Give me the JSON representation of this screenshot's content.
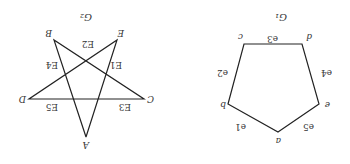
{
  "figure": {
    "orientation": "rotated 180 degrees",
    "graphs": [
      {
        "id": "G1",
        "title": "G₁",
        "shape": "pentagon",
        "vertices": [
          "a",
          "b",
          "c",
          "d",
          "e"
        ],
        "edges": [
          {
            "label": "e1",
            "from": "a",
            "to": "b"
          },
          {
            "label": "e2",
            "from": "b",
            "to": "c"
          },
          {
            "label": "e3",
            "from": "c",
            "to": "d"
          },
          {
            "label": "e4",
            "from": "d",
            "to": "e"
          },
          {
            "label": "e5",
            "from": "e",
            "to": "a"
          }
        ]
      },
      {
        "id": "G2",
        "title": "G₂",
        "shape": "pentagram",
        "vertices": [
          "A",
          "B",
          "C",
          "D",
          "E"
        ],
        "edges": [
          {
            "label": "E1",
            "from": "B",
            "to": "C"
          },
          {
            "label": "E2",
            "from": "B",
            "to": "A"
          },
          {
            "label": "E3",
            "from": "C",
            "to": "D"
          },
          {
            "label": "E4",
            "from": "D",
            "to": "E"
          },
          {
            "label": "E5",
            "from": "E",
            "to": "A"
          }
        ]
      }
    ]
  },
  "labels": {
    "g1_title": "G₁",
    "g2_title": "G₂",
    "g1": {
      "a": "a",
      "b": "b",
      "c": "c",
      "d": "d",
      "e": "e",
      "e1": "e1",
      "e2": "e2",
      "e3": "e3",
      "e4": "e4",
      "e5": "e5"
    },
    "g2": {
      "A": "A",
      "B": "B",
      "C": "C",
      "D": "D",
      "E": "E",
      "E1": "E1",
      "E2": "E2",
      "E3": "E3",
      "E4": "E4",
      "E5": "E5"
    }
  }
}
